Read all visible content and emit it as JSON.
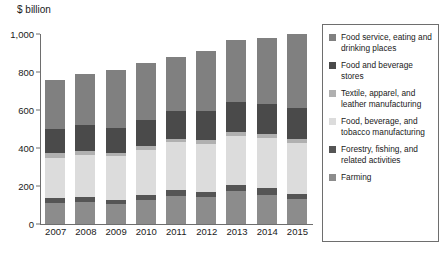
{
  "chart_data": {
    "type": "bar",
    "stacked": true,
    "title": "",
    "subtitle": "",
    "xlabel": "",
    "ylabel": "$ billion",
    "unit_label": "$ billion",
    "ylim": [
      0,
      1000
    ],
    "yticks": [
      "0",
      "200",
      "400",
      "600",
      "800",
      "1,000"
    ],
    "ytick_values": [
      0,
      200,
      400,
      600,
      800,
      1000
    ],
    "grid": false,
    "legend_position": "right",
    "categories": [
      "2007",
      "2008",
      "2009",
      "2010",
      "2011",
      "2012",
      "2013",
      "2014",
      "2015"
    ],
    "series": [
      {
        "name": "Farming",
        "color": "#8c8c8c",
        "values": [
          110,
          115,
          105,
          125,
          150,
          140,
          175,
          155,
          130
        ]
      },
      {
        "name": "Forestry, fishing, and related activities",
        "color": "#555555",
        "values": [
          25,
          25,
          22,
          26,
          30,
          28,
          30,
          32,
          28
        ]
      },
      {
        "name": "Food, beverage, and tobacco manufacturing",
        "color": "#dcdcdc",
        "values": [
          215,
          225,
          230,
          240,
          250,
          255,
          260,
          265,
          270
        ]
      },
      {
        "name": "Textile, apparel, and leather manufacturing",
        "color": "#b0b0b0",
        "values": [
          22,
          20,
          16,
          18,
          20,
          20,
          20,
          20,
          20
        ]
      },
      {
        "name": "Food and beverage stores",
        "color": "#4a4a4a",
        "values": [
          130,
          135,
          135,
          140,
          145,
          150,
          155,
          160,
          165
        ]
      },
      {
        "name": "Food service, eating and drinking places",
        "color": "#808080",
        "values": [
          258,
          270,
          302,
          301,
          285,
          317,
          330,
          348,
          387
        ]
      }
    ],
    "totals": [
      760,
      790,
      810,
      850,
      880,
      910,
      970,
      980,
      1000
    ],
    "legend_entries": [
      {
        "label": "Food service, eating and drinking places",
        "color": "#808080"
      },
      {
        "label": "Food and beverage stores",
        "color": "#4a4a4a"
      },
      {
        "label": "Textile, apparel, and leather manufacturing",
        "color": "#b0b0b0"
      },
      {
        "label": "Food, beverage, and tobacco manufacturing",
        "color": "#dcdcdc"
      },
      {
        "label": "Forestry, fishing, and related activities",
        "color": "#555555"
      },
      {
        "label": "Farming",
        "color": "#8c8c8c"
      }
    ]
  }
}
